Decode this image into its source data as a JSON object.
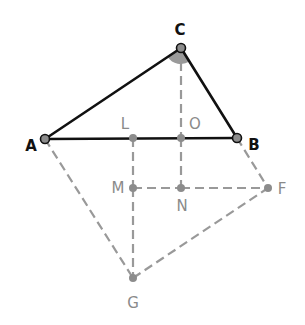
{
  "diagram": {
    "type": "geometry-construction",
    "colors": {
      "main": "#111111",
      "aux": "#999999",
      "point_fill": "#8c8c8c",
      "angle_fill": "#9a9a9a"
    },
    "points": [
      {
        "id": "A",
        "label": "A",
        "style": "main"
      },
      {
        "id": "B",
        "label": "B",
        "style": "main"
      },
      {
        "id": "C",
        "label": "C",
        "style": "main"
      },
      {
        "id": "L",
        "label": "L",
        "style": "aux"
      },
      {
        "id": "O",
        "label": "O",
        "style": "aux"
      },
      {
        "id": "M",
        "label": "M",
        "style": "aux"
      },
      {
        "id": "N",
        "label": "N",
        "style": "aux"
      },
      {
        "id": "F",
        "label": "F",
        "style": "aux"
      },
      {
        "id": "G",
        "label": "G",
        "style": "aux"
      }
    ],
    "solid_segments": [
      [
        "A",
        "B"
      ],
      [
        "B",
        "C"
      ],
      [
        "C",
        "A"
      ]
    ],
    "dashed_segments": [
      [
        "C",
        "O"
      ],
      [
        "O",
        "N"
      ],
      [
        "L",
        "M"
      ],
      [
        "M",
        "G"
      ],
      [
        "M",
        "N"
      ],
      [
        "N",
        "F"
      ],
      [
        "B",
        "F"
      ],
      [
        "A",
        "G"
      ],
      [
        "G",
        "F"
      ]
    ],
    "marked_angle": {
      "vertex": "C",
      "between": [
        "A",
        "B"
      ]
    }
  }
}
